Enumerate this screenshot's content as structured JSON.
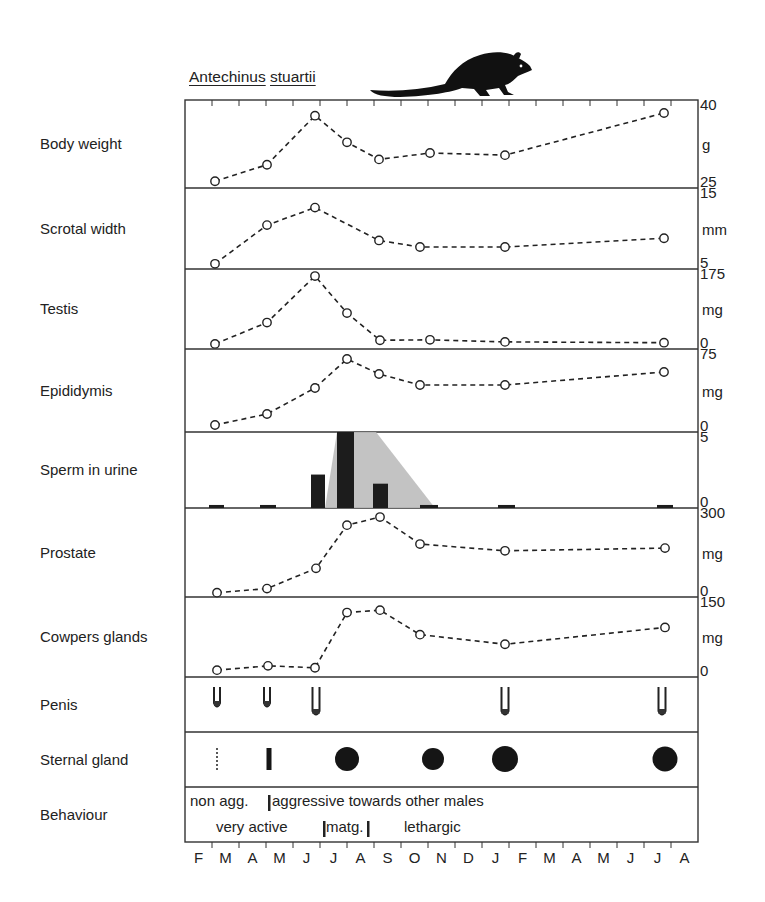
{
  "title": {
    "genus": "Antechinus",
    "species": "stuartii"
  },
  "months": [
    "F",
    "M",
    "A",
    "M",
    "J",
    "J",
    "A",
    "S",
    "O",
    "N",
    "D",
    "J",
    "F",
    "M",
    "A",
    "M",
    "J",
    "J",
    "A"
  ],
  "behaviour": {
    "row1": [
      {
        "text": "non agg.",
        "x": 190
      },
      {
        "text": "aggressive towards other males",
        "x": 272
      }
    ],
    "row2": [
      {
        "text": "very active",
        "x": 216
      },
      {
        "text": "matg.",
        "x": 326
      },
      {
        "text": "lethargic",
        "x": 404
      }
    ],
    "markers_row1": [
      269
    ],
    "markers_row2": [
      324,
      368
    ]
  },
  "panels": [
    {
      "id": "body-weight",
      "label": "Body weight",
      "unit": "g",
      "ymax_label": "40",
      "ymin_label": "25",
      "top": 100,
      "bottom": 188,
      "ymin": 25,
      "ymax": 40
    },
    {
      "id": "scrotal-width",
      "label": "Scrotal width",
      "unit": "mm",
      "ymax_label": "15",
      "ymin_label": "5",
      "top": 188,
      "bottom": 269,
      "ymin": 5,
      "ymax": 15
    },
    {
      "id": "testis",
      "label": "Testis",
      "unit": "mg",
      "ymax_label": "175",
      "ymin_label": "0",
      "top": 269,
      "bottom": 349,
      "ymin": 0,
      "ymax": 175
    },
    {
      "id": "epididymis",
      "label": "Epididymis",
      "unit": "mg",
      "ymax_label": "75",
      "ymin_label": "0",
      "top": 349,
      "bottom": 432,
      "ymin": 0,
      "ymax": 75
    },
    {
      "id": "sperm-in-urine",
      "label": "Sperm in urine",
      "unit": "",
      "ymax_label": "5",
      "ymin_label": "0",
      "top": 432,
      "bottom": 508,
      "ymin": 0,
      "ymax": 5
    },
    {
      "id": "prostate",
      "label": "Prostate",
      "unit": "mg",
      "ymax_label": "300",
      "ymin_label": "0",
      "top": 508,
      "bottom": 597,
      "ymin": 0,
      "ymax": 300
    },
    {
      "id": "cowpers-glands",
      "label": "Cowpers glands",
      "unit": "mg",
      "ymax_label": "150",
      "ymin_label": "0",
      "top": 597,
      "bottom": 677,
      "ymin": 0,
      "ymax": 150
    },
    {
      "id": "penis",
      "label": "Penis",
      "unit": "",
      "ymax_label": "",
      "ymin_label": "",
      "top": 677,
      "bottom": 732
    },
    {
      "id": "sternal-gland",
      "label": "Sternal gland",
      "unit": "",
      "ymax_label": "",
      "ymin_label": "",
      "top": 732,
      "bottom": 787
    },
    {
      "id": "behaviour",
      "label": "Behaviour",
      "unit": "",
      "ymax_label": "",
      "ymin_label": "",
      "top": 787,
      "bottom": 842
    }
  ],
  "chart_data": {
    "type": "line",
    "title": "Antechinus stuartii",
    "xlabel": "Month (Feb to Aug of following year)",
    "x_categories": [
      "F",
      "M",
      "A",
      "M",
      "J",
      "J",
      "A",
      "S",
      "O",
      "N",
      "D",
      "J",
      "F",
      "M",
      "A",
      "M",
      "J",
      "J",
      "A"
    ],
    "sample_x_px": [
      215,
      267,
      315,
      347,
      379,
      430,
      505,
      664
    ],
    "sample_months": [
      "M",
      "M",
      "J",
      "A",
      "S",
      "N",
      "J",
      "J"
    ],
    "series": [
      {
        "name": "Body weight",
        "unit": "g",
        "ylim": [
          25,
          40
        ],
        "values": [
          25.7,
          28.8,
          38.0,
          33.0,
          29.8,
          31.0,
          30.6,
          38.5
        ]
      },
      {
        "name": "Scrotal width",
        "unit": "mm",
        "ylim": [
          5,
          15
        ],
        "values": [
          5.3,
          10.6,
          13.0,
          8.5,
          7.6,
          null,
          7.6,
          8.8
        ]
      },
      {
        "name": "Testis",
        "unit": "mg",
        "ylim": [
          0,
          175
        ],
        "values": [
          5,
          57,
          170,
          80,
          14,
          15,
          null,
          8
        ]
      },
      {
        "name": "Epididymis",
        "unit": "mg",
        "ylim": [
          0,
          75
        ],
        "values": [
          4,
          15,
          41,
          70,
          55,
          null,
          44,
          57
        ]
      },
      {
        "name": "Sperm in urine",
        "type": "bar",
        "ylim": [
          0,
          5
        ],
        "bars": [
          {
            "x0": 209,
            "x1": 224,
            "value": 0.2
          },
          {
            "x0": 260,
            "x1": 276,
            "value": 0.2
          },
          {
            "x0": 311,
            "x1": 325,
            "value": 2.2
          },
          {
            "x0": 337,
            "x1": 354,
            "value": 5.0
          },
          {
            "x0": 373,
            "x1": 388,
            "value": 1.6
          },
          {
            "x0": 420,
            "x1": 438,
            "value": 0.2
          },
          {
            "x0": 498,
            "x1": 515,
            "value": 0.2
          },
          {
            "x0": 657,
            "x1": 673,
            "value": 0.2
          }
        ],
        "shaded_region": [
          [
            325,
            508
          ],
          [
            337,
            432
          ],
          [
            376,
            432
          ],
          [
            435,
            508
          ]
        ]
      },
      {
        "name": "Prostate",
        "unit": "mg",
        "ylim": [
          0,
          300
        ],
        "values": [
          5,
          20,
          95,
          255,
          285,
          185,
          null,
          160
        ]
      },
      {
        "name": "Cowpers glands",
        "unit": "mg",
        "ylim": [
          0,
          150
        ],
        "values": [
          8,
          17,
          13,
          128,
          133,
          82,
          null,
          97
        ]
      }
    ],
    "series_x_override": {
      "Scrotal width": [
        215,
        267,
        315,
        379,
        420,
        505,
        664
      ],
      "Testis": [
        215,
        267,
        315,
        347,
        380,
        430,
        505,
        664
      ],
      "Epididymis": [
        215,
        267,
        315,
        347,
        379,
        420,
        505,
        664
      ],
      "Prostate": [
        217,
        267,
        316,
        347,
        380,
        420,
        505,
        665
      ],
      "Cowpers glands": [
        217,
        268,
        315,
        347,
        380,
        420,
        505,
        665
      ]
    },
    "series_values_override": {
      "Scrotal width": [
        5.3,
        10.6,
        13.0,
        8.5,
        7.6,
        7.6,
        8.8
      ],
      "Testis": [
        5,
        57,
        170,
        80,
        14,
        15,
        10,
        8
      ],
      "Epididymis": [
        4,
        15,
        41,
        70,
        55,
        44,
        44,
        57
      ],
      "Prostate": [
        5,
        20,
        95,
        255,
        285,
        185,
        160,
        170
      ],
      "Cowpers glands": [
        8,
        17,
        13,
        128,
        133,
        82,
        62,
        97
      ]
    },
    "penis_glyphs": [
      {
        "x": 217,
        "size": "small"
      },
      {
        "x": 267,
        "size": "small"
      },
      {
        "x": 316,
        "size": "large"
      },
      {
        "x": 505,
        "size": "large"
      },
      {
        "x": 662,
        "size": "large"
      }
    ],
    "sternal_gland": [
      {
        "x": 217,
        "type": "dotted-line"
      },
      {
        "x": 269,
        "type": "bar"
      },
      {
        "x": 347,
        "type": "dot",
        "r": 12
      },
      {
        "x": 433,
        "type": "dot",
        "r": 11
      },
      {
        "x": 505,
        "type": "dot",
        "r": 13
      },
      {
        "x": 665,
        "type": "dot",
        "r": 12.5
      }
    ],
    "legend": []
  }
}
